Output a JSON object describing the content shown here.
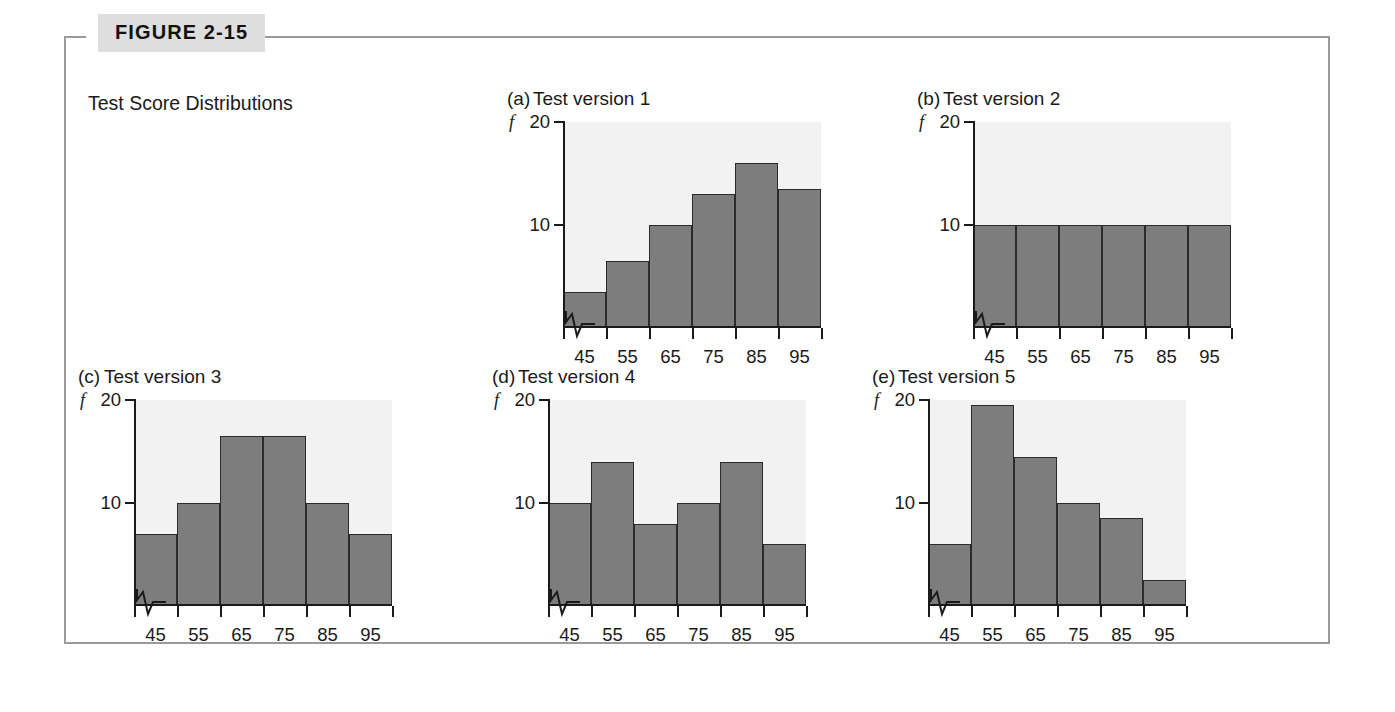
{
  "figure": {
    "label": "FIGURE 2-15",
    "caption": "Test Score Distributions"
  },
  "axes": {
    "y_label": "f",
    "y_ticks": [
      "20",
      "10"
    ],
    "x_ticks": [
      "45",
      "55",
      "65",
      "75",
      "85",
      "95"
    ]
  },
  "charts": [
    {
      "panel": "(a)",
      "title": "Test version 1"
    },
    {
      "panel": "(b)",
      "title": "Test version 2"
    },
    {
      "panel": "(c)",
      "title": "Test version 3"
    },
    {
      "panel": "(d)",
      "title": "Test version 4"
    },
    {
      "panel": "(e)",
      "title": "Test version 5"
    }
  ],
  "chart_data": [
    {
      "type": "bar",
      "title": "(a) Test version 1",
      "categories": [
        "45",
        "55",
        "65",
        "75",
        "85",
        "95"
      ],
      "values": [
        3.5,
        6.5,
        10,
        13,
        16,
        13.5
      ],
      "xlabel": "",
      "ylabel": "f",
      "ylim": [
        0,
        20
      ],
      "yticks": [
        10,
        20
      ],
      "grid": false,
      "legend": false,
      "axis_break_x": true,
      "shape": "negatively skewed"
    },
    {
      "type": "bar",
      "title": "(b) Test version 2",
      "categories": [
        "45",
        "55",
        "65",
        "75",
        "85",
        "95"
      ],
      "values": [
        10,
        10,
        10,
        10,
        10,
        10
      ],
      "xlabel": "",
      "ylabel": "f",
      "ylim": [
        0,
        20
      ],
      "yticks": [
        10,
        20
      ],
      "grid": false,
      "legend": false,
      "axis_break_x": true,
      "shape": "uniform / rectangular"
    },
    {
      "type": "bar",
      "title": "(c) Test version 3",
      "categories": [
        "45",
        "55",
        "65",
        "75",
        "85",
        "95"
      ],
      "values": [
        7,
        10,
        16.5,
        16.5,
        10,
        7
      ],
      "xlabel": "",
      "ylabel": "f",
      "ylim": [
        0,
        20
      ],
      "yticks": [
        10,
        20
      ],
      "grid": false,
      "legend": false,
      "axis_break_x": true,
      "shape": "symmetric / bell-shaped"
    },
    {
      "type": "bar",
      "title": "(d) Test version 4",
      "categories": [
        "45",
        "55",
        "65",
        "75",
        "85",
        "95"
      ],
      "values": [
        10,
        14,
        8,
        10,
        14,
        6
      ],
      "xlabel": "",
      "ylabel": "f",
      "ylim": [
        0,
        20
      ],
      "yticks": [
        10,
        20
      ],
      "grid": false,
      "legend": false,
      "axis_break_x": true,
      "shape": "bimodal / irregular"
    },
    {
      "type": "bar",
      "title": "(e) Test version 5",
      "categories": [
        "45",
        "55",
        "65",
        "75",
        "85",
        "95"
      ],
      "values": [
        6,
        19.5,
        14.5,
        10,
        8.5,
        2.5
      ],
      "xlabel": "",
      "ylabel": "f",
      "ylim": [
        0,
        20
      ],
      "yticks": [
        10,
        20
      ],
      "grid": false,
      "legend": false,
      "axis_break_x": true,
      "shape": "positively skewed"
    }
  ],
  "style": {
    "bar_fill": "#7d7d7d",
    "bar_stroke": "#2b2b2b",
    "axis_color": "#1a1a1a",
    "frame_color": "#9a9a9a",
    "tab_background": "#dedede",
    "plot_background": "#f2f2f2"
  }
}
